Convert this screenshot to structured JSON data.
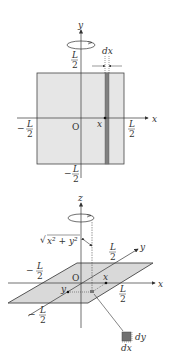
{
  "figure_top": {
    "description": "Square plate of side L rotating about the y-axis, thin strip of width dx at position x",
    "axis_y_label": "y",
    "axis_x_label": "x",
    "origin_label": "O",
    "top_L": "L",
    "top_den": "2",
    "bottom_minus": "−",
    "bottom_L": "L",
    "bottom_den": "2",
    "left_minus": "−",
    "left_L": "L",
    "left_den": "2",
    "right_L": "L",
    "right_den": "2",
    "strip_width_label": "dx",
    "strip_position_label": "x",
    "colors": {
      "plate": "#e6e6e6",
      "strip": "#808080",
      "line": "#333333"
    }
  },
  "figure_bottom": {
    "description": "Square plate in the xy-plane rotating about the z-axis, area element dx·dy at distance √(x²+y²)",
    "axis_z_label": "z",
    "axis_y_label": "y",
    "axis_x_label": "x",
    "origin_label": "O",
    "distance_label": "x² + y²",
    "sqrt_sign": "√",
    "y_pos_L": "L",
    "y_pos_den": "2",
    "x_neg_minus": "−",
    "x_neg_L": "L",
    "x_neg_den": "2",
    "x_pos_L": "L",
    "x_pos_den": "2",
    "y_neg_minus": "−",
    "y_neg_L": "L",
    "y_neg_den": "2",
    "point_x_label": "x",
    "point_y_label": "y",
    "element_dy_label": "dy",
    "element_dx_label": "dx",
    "colors": {
      "plate": "#d9d9d9",
      "plate_edge": "#555555",
      "element": "#707070"
    }
  }
}
